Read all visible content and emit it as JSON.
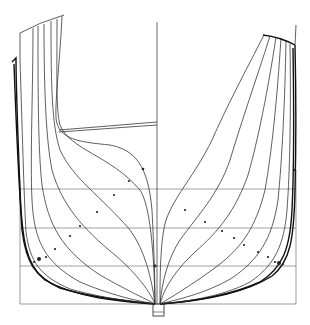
{
  "drawing": {
    "title": "",
    "type": "ship body plan (lines drawing)",
    "colors": {
      "ink": "#2a2a2a",
      "heavy_ink": "#111111",
      "grid": "#7a7a7a",
      "background": "#ffffff"
    },
    "centerline_x": 157,
    "baseline_y": 304,
    "frame_box": {
      "x1": 20,
      "x2": 296,
      "y1": 0,
      "y2": 304
    },
    "waterlines_y": [
      189,
      228,
      266
    ],
    "keel": {
      "x": 153,
      "y": 304,
      "w": 11,
      "h": 12
    },
    "deck_line": {
      "x1": 59,
      "y1": 132,
      "x2": 157,
      "y2": 124
    },
    "stations_left_count": 9,
    "stations_right_count": 8
  }
}
